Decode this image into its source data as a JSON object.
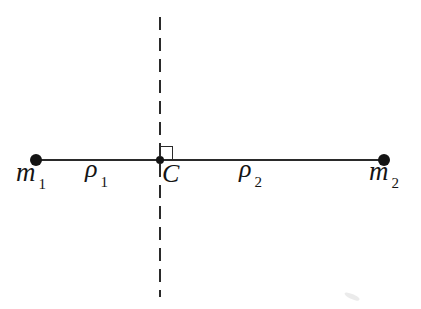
{
  "figure": {
    "colors": {
      "background": "#ffffff",
      "line": "#2a2a2a",
      "ink": "#141414"
    },
    "labels": {
      "mass1": {
        "base": "m",
        "sub": "1"
      },
      "rho1": {
        "base": "ρ",
        "sub": "1"
      },
      "center": {
        "base": "C"
      },
      "rho2": {
        "base": "ρ",
        "sub": "2"
      },
      "mass2": {
        "base": "m",
        "sub": "2"
      }
    }
  }
}
